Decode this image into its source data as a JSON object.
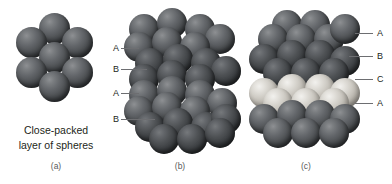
{
  "figure": {
    "background_color": "#ffffff",
    "text_color": "#231f20",
    "leader_color": "#6d6e71"
  },
  "colors": {
    "sphere_dark": "#4e5154",
    "sphere_deep": "#3b3e41",
    "sphere_light": "#cfccc5",
    "highlight": "#8e9093"
  },
  "panels": [
    {
      "id": "a",
      "caption_letter": "(a)",
      "caption_line1": "Close-packed",
      "caption_line2": "layer of spheres",
      "sphere_count": 7,
      "layer_labels": []
    },
    {
      "id": "b",
      "caption_letter": "(b)",
      "stacking": "ABAB",
      "layer_labels": [
        "A",
        "B",
        "A",
        "B"
      ]
    },
    {
      "id": "c",
      "caption_letter": "(c)",
      "stacking": "ABCA",
      "layer_labels": [
        "A",
        "B",
        "C",
        "A"
      ]
    }
  ],
  "labels_b": [
    {
      "text": "A"
    },
    {
      "text": "B"
    },
    {
      "text": "A"
    },
    {
      "text": "B"
    }
  ],
  "labels_c": [
    {
      "text": "A"
    },
    {
      "text": "B"
    },
    {
      "text": "C"
    },
    {
      "text": "A"
    }
  ]
}
